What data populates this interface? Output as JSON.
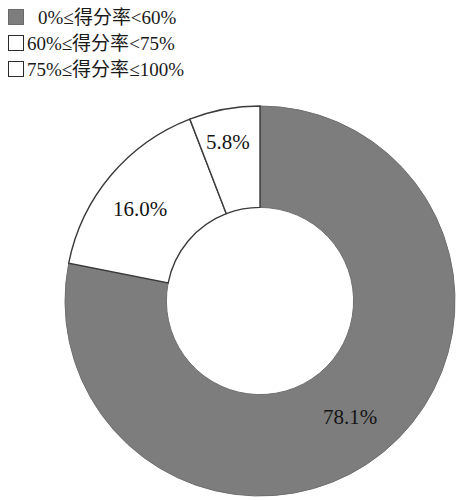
{
  "legend": {
    "items": [
      {
        "label": "0%≤得分率<60%",
        "swatch": "filled-gray-square",
        "color": "#7d7d7d"
      },
      {
        "label": "60%≤得分率<75%",
        "swatch": "hollow-white-square",
        "color": "#ffffff"
      },
      {
        "label": "75%≤得分率≤100%",
        "swatch": "hollow-white-square",
        "color": "#ffffff"
      }
    ]
  },
  "chart_data": {
    "type": "pie",
    "variant": "donut",
    "title": "",
    "subtitle": "",
    "xlabel": "",
    "ylabel": "",
    "grid": false,
    "legend_position": "top-left",
    "units": "percent",
    "start_angle_deg": 0,
    "direction": "clockwise",
    "inner_radius_ratio": 0.48,
    "categories": [
      "0%≤得分率<60%",
      "60%≤得分率<75%",
      "75%≤得分率≤100%"
    ],
    "values": [
      78.1,
      16.0,
      5.8
    ],
    "labels": [
      "78.1%",
      "16.0%",
      "5.8%"
    ],
    "colors": [
      "#7d7d7d",
      "#ffffff",
      "#ffffff"
    ],
    "slices": [
      {
        "name": "0%≤得分率<60%",
        "value": 78.1,
        "label": "78.1%",
        "color": "#7d7d7d",
        "start_deg": 0.0,
        "end_deg": 281.2
      },
      {
        "name": "60%≤得分率<75%",
        "value": 16.0,
        "label": "16.0%",
        "color": "#ffffff",
        "start_deg": 281.2,
        "end_deg": 338.9
      },
      {
        "name": "75%≤得分率≤100%",
        "value": 5.8,
        "label": "5.8%",
        "color": "#ffffff",
        "start_deg": 338.9,
        "end_deg": 360.0
      }
    ]
  },
  "slice_labels": {
    "gray": "78.1%",
    "white_large": "16.0%",
    "white_small": "5.8%"
  }
}
